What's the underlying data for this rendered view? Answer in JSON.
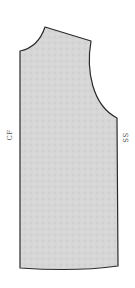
{
  "diagram": {
    "type": "sewing-pattern-bodice-front",
    "fill_color": "#d4d4d4",
    "stroke_color": "#2a2a2a",
    "labels": {
      "center_front": "CF",
      "side_seam": "SS"
    }
  }
}
